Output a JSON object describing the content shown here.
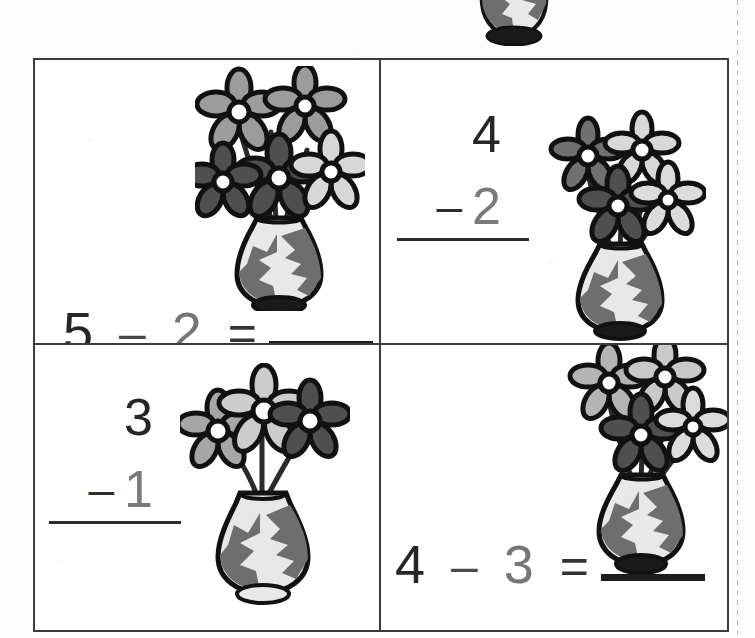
{
  "page": {
    "background_color": "#ffffff",
    "cut_line_color": "#b9b9b9"
  },
  "art": {
    "name": "flower-vase-clipart",
    "outline_color": "#111111",
    "vase_body_color": "#e8e8e8",
    "vase_patch_color": "#6e6e6e",
    "vase_base_color": "#1a1a1a",
    "petal_light_color": "#9c9c9c",
    "petal_dark_color": "#4f4f4f",
    "flower_center_color": "#ffffff",
    "stem_color": "#2a2a2a"
  },
  "top_partial_image": {
    "name": "cropped-vase-top-of-page",
    "description": "bottom half of a flower vase clipped by the top page edge"
  },
  "problems": [
    {
      "id": "problem-1",
      "position": "top-left",
      "format": "horizontal",
      "minuend": "5",
      "operator": "–",
      "subtrahend": "2",
      "equals": "=",
      "answer": "",
      "flower_count": 5,
      "flower_petal_shades": [
        "light",
        "light",
        "dark",
        "dark",
        "light"
      ]
    },
    {
      "id": "problem-2",
      "position": "top-right",
      "format": "vertical",
      "minuend": "4",
      "operator": "–",
      "subtrahend": "2",
      "answer": "",
      "flower_count": 4,
      "flower_petal_shades": [
        "dark",
        "light",
        "dark",
        "light"
      ]
    },
    {
      "id": "problem-3",
      "position": "bottom-left",
      "format": "vertical",
      "minuend": "3",
      "operator": "–",
      "subtrahend": "1",
      "answer": "",
      "flower_count": 3,
      "flower_petal_shades": [
        "light",
        "light",
        "dark"
      ]
    },
    {
      "id": "problem-4",
      "position": "bottom-right",
      "format": "horizontal",
      "minuend": "4",
      "operator": "–",
      "subtrahend": "3",
      "equals": "=",
      "answer": "",
      "flower_count": 4,
      "flower_petal_shades": [
        "light",
        "light",
        "dark",
        "light"
      ]
    }
  ],
  "colors": {
    "border": "#3c3c3c",
    "ink_dark": "#262626",
    "ink_mid": "#4a4a4a",
    "ink_light": "#767676",
    "blank_line": "#1d1d1d"
  }
}
